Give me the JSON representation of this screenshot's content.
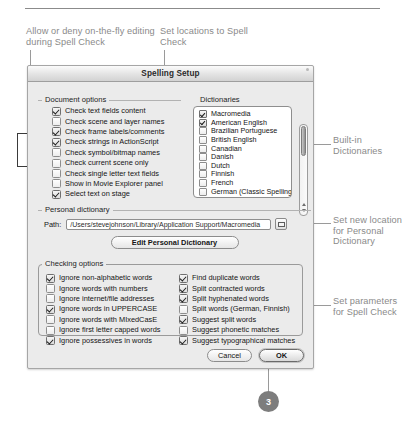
{
  "annotations": {
    "top_left": "Allow or deny on-the-fly editing during Spell Check",
    "top_middle": "Set locations to Spell Check",
    "right_1": "Built-in Dictionaries",
    "right_2": "Set new location for Personal Dictionary",
    "right_3": "Set parameters for Spell Check",
    "step_badge": "3"
  },
  "dialog": {
    "title": "Spelling Setup",
    "document_options": {
      "legend": "Document options",
      "items": [
        {
          "label": "Check text fields content",
          "checked": true
        },
        {
          "label": "Check scene and layer names",
          "checked": false
        },
        {
          "label": "Check frame labels/comments",
          "checked": true
        },
        {
          "label": "Check strings in ActionScript",
          "checked": true
        },
        {
          "label": "Check symbol/bitmap names",
          "checked": false
        },
        {
          "label": "Check current scene only",
          "checked": false
        },
        {
          "label": "Check single letter text fields",
          "checked": false
        },
        {
          "label": "Show in Movie Explorer panel",
          "checked": false
        },
        {
          "label": "Select text on stage",
          "checked": true
        }
      ]
    },
    "dictionaries": {
      "legend": "Dictionaries",
      "items": [
        {
          "label": "Macromedia",
          "checked": true
        },
        {
          "label": "American English",
          "checked": true
        },
        {
          "label": "Brazilian Portuguese",
          "checked": false
        },
        {
          "label": "British English",
          "checked": false
        },
        {
          "label": "Canadian",
          "checked": false
        },
        {
          "label": "Danish",
          "checked": false
        },
        {
          "label": "Dutch",
          "checked": false
        },
        {
          "label": "Finnish",
          "checked": false
        },
        {
          "label": "French",
          "checked": false
        },
        {
          "label": "German (Classic Spelling)",
          "checked": false
        }
      ]
    },
    "personal_dictionary": {
      "legend": "Personal dictionary",
      "path_label": "Path:",
      "path_value": "/Users/stevejohnson/Library/Application Support/Macromedia",
      "edit_button": "Edit Personal Dictionary"
    },
    "checking_options": {
      "legend": "Checking options",
      "column_left": [
        {
          "label": "Ignore non-alphabetic words",
          "checked": true
        },
        {
          "label": "Ignore words with numbers",
          "checked": false
        },
        {
          "label": "Ignore internet/file addresses",
          "checked": false
        },
        {
          "label": "Ignore words in UPPERCASE",
          "checked": true
        },
        {
          "label": "Ignore words with MIxedCasE",
          "checked": false
        },
        {
          "label": "Ignore first letter capped words",
          "checked": false
        },
        {
          "label": "Ignore possessives in words",
          "checked": true
        }
      ],
      "column_right": [
        {
          "label": "Find duplicate words",
          "checked": true
        },
        {
          "label": "Split contracted words",
          "checked": true
        },
        {
          "label": "Split hyphenated words",
          "checked": true
        },
        {
          "label": "Split words (German, Finnish)",
          "checked": false
        },
        {
          "label": "Suggest split words",
          "checked": true
        },
        {
          "label": "Suggest phonetic matches",
          "checked": false
        },
        {
          "label": "Suggest typographical matches",
          "checked": true
        }
      ]
    },
    "buttons": {
      "cancel": "Cancel",
      "ok": "OK"
    }
  }
}
